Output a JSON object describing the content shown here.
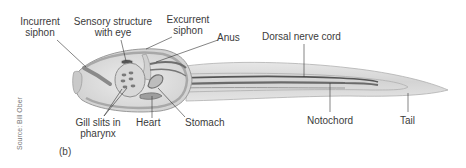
{
  "figure": {
    "panel_label": "(b)",
    "credit": "Source: Bill Ober",
    "labels": {
      "incurrent_siphon": [
        "Incurrent",
        "siphon"
      ],
      "sensory_structure": [
        "Sensory structure",
        "with eye"
      ],
      "excurrent_siphon": [
        "Excurrent",
        "siphon"
      ],
      "anus": "Anus",
      "dorsal_nerve_cord": "Dorsal nerve cord",
      "gill_slits": [
        "Gill slits in",
        "pharynx"
      ],
      "heart": "Heart",
      "stomach": "Stomach",
      "notochord": "Notochord",
      "tail": "Tail"
    },
    "colors": {
      "body_fill": "#dcdcdc",
      "body_outline": "#9a9a9a",
      "dark_band": "#6e6e6e",
      "leader_line": "#333333"
    }
  }
}
